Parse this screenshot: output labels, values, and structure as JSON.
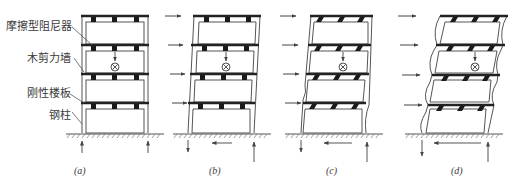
{
  "figure": {
    "labels": {
      "friction_damper": "摩擦型阻尼器",
      "wood_shear_wall": "木剪力墙",
      "rigid_floor": "刚性楼板",
      "steel_column": "钢柱"
    },
    "panels": [
      {
        "id": "a",
        "caption": "(a)",
        "state": "initial, undeformed"
      },
      {
        "id": "b",
        "caption": "(b)",
        "state": "rigid drift, dampers intact"
      },
      {
        "id": "c",
        "caption": "(c)",
        "state": "dampers slipping, slight column bending"
      },
      {
        "id": "d",
        "caption": "(d)",
        "state": "large drift, columns buckling"
      }
    ],
    "colors": {
      "line": "#555555",
      "slab": "#2a2a2a",
      "ground_hatch": "#777777"
    }
  }
}
